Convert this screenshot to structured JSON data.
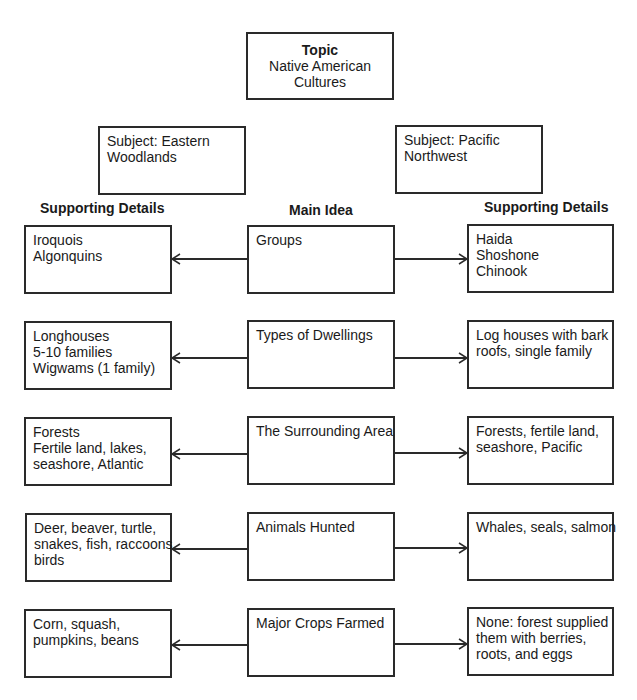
{
  "topic": {
    "title": "Topic",
    "lines": [
      "Native American",
      "Cultures"
    ]
  },
  "subjects": {
    "left": [
      "Subject: Eastern",
      "Woodlands"
    ],
    "right": [
      "Subject: Pacific",
      "Northwest"
    ]
  },
  "headers": {
    "left": "Supporting Details",
    "center": "Main Idea",
    "right": "Supporting Details"
  },
  "rows": [
    {
      "main": "Groups",
      "left": [
        "Iroquois",
        "Algonquins"
      ],
      "right": [
        "Haida",
        "Shoshone",
        "Chinook"
      ]
    },
    {
      "main": "Types of Dwellings",
      "left": [
        "Longhouses",
        "5-10 families",
        "Wigwams (1 family)"
      ],
      "right": [
        "Log houses with bark",
        "roofs, single family"
      ]
    },
    {
      "main": "The Surrounding Area",
      "left": [
        "Forests",
        "Fertile land, lakes,",
        "seashore, Atlantic"
      ],
      "right": [
        "Forests, fertile land,",
        "seashore, Pacific"
      ]
    },
    {
      "main": "Animals Hunted",
      "left": [
        "Deer, beaver, turtle,",
        "snakes, fish, raccoons",
        "birds"
      ],
      "right": [
        "Whales, seals, salmon"
      ]
    },
    {
      "main": "Major Crops Farmed",
      "left": [
        "Corn, squash,",
        "pumpkins, beans"
      ],
      "right": [
        "None: forest supplied",
        "them with berries,",
        "roots, and eggs"
      ]
    }
  ],
  "colors": {
    "line": "#2a2a2a",
    "background": "#ffffff"
  }
}
